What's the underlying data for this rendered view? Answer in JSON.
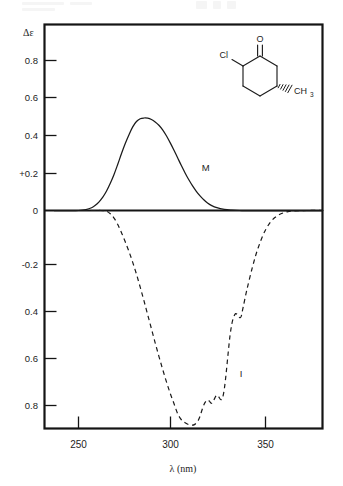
{
  "figure": {
    "kind": "cd-spectrum-plot",
    "background_color": "#ffffff",
    "ink_color": "#1a1a1a"
  },
  "chart_data": {
    "type": "line",
    "title": "",
    "subtitle": "",
    "xlabel": "λ  (nm)",
    "ylabel": "Δε",
    "xlim": [
      233,
      383
    ],
    "ylim": [
      -0.9,
      0.92
    ],
    "grid": false,
    "legend_position": "inline-annotation",
    "x_tick_labels": [
      "250",
      "300",
      "350"
    ],
    "x_tick_values": [
      250,
      300,
      350
    ],
    "y_tick_labels": [
      "0.8",
      "0.6",
      "0.4",
      "+0.2",
      "0",
      "-0.2",
      "0.4",
      "0.6",
      "0.8"
    ],
    "y_tick_values": [
      0.8,
      0.6,
      0.4,
      0.2,
      0,
      -0.2,
      -0.4,
      -0.6,
      -0.8
    ],
    "annotations": [
      {
        "text": "M",
        "x": 318,
        "y": 0.235,
        "series": "M"
      },
      {
        "text": "I",
        "x": 337,
        "y": -0.605,
        "series": "I"
      }
    ],
    "series": [
      {
        "name": "M",
        "label": "M",
        "style": "solid",
        "description": "positive Cotton effect band, single smooth maximum",
        "peak_x": 286,
        "peak_y": 0.5,
        "x": [
          237,
          242,
          246,
          250,
          254,
          257,
          259,
          261,
          263,
          265,
          267,
          269,
          271,
          273,
          275,
          277,
          279,
          281,
          283,
          285,
          287,
          289,
          291,
          293,
          295,
          297,
          299,
          301,
          303,
          305,
          307,
          309,
          311,
          313,
          315,
          317,
          319,
          321,
          324,
          328,
          332,
          336,
          340,
          345,
          352,
          360,
          370,
          380
        ],
        "y": [
          0.0,
          0.0,
          0.0,
          0.0,
          0.005,
          0.015,
          0.028,
          0.047,
          0.072,
          0.105,
          0.147,
          0.195,
          0.25,
          0.308,
          0.362,
          0.41,
          0.452,
          0.481,
          0.496,
          0.5,
          0.499,
          0.492,
          0.479,
          0.461,
          0.436,
          0.404,
          0.367,
          0.327,
          0.285,
          0.243,
          0.203,
          0.166,
          0.133,
          0.104,
          0.079,
          0.058,
          0.041,
          0.028,
          0.015,
          0.006,
          0.002,
          0.0,
          0.0,
          0.0,
          0.0,
          0.0,
          0.0,
          0.0
        ]
      },
      {
        "name": "I",
        "label": "I",
        "style": "dashed",
        "description": "negative Cotton effect band with vibrational fine structure near minimum",
        "trough_x": 314,
        "trough_y": -0.795,
        "x": [
          248,
          254,
          258,
          262,
          265,
          267,
          269,
          271,
          273,
          275,
          277,
          279,
          281,
          283,
          285,
          287,
          289,
          291,
          293,
          295,
          297,
          299,
          301,
          303,
          305,
          307,
          309,
          311,
          312,
          313,
          314,
          315,
          316,
          317,
          318,
          319,
          320,
          321,
          322,
          323,
          324,
          325,
          326,
          327,
          328,
          329,
          330,
          331,
          332,
          333,
          334,
          335,
          336,
          337,
          338,
          340,
          343,
          346,
          350,
          355,
          362,
          372,
          381
        ],
        "y": [
          0.0,
          0.0,
          0.0,
          0.0,
          -0.003,
          -0.012,
          -0.028,
          -0.052,
          -0.082,
          -0.116,
          -0.152,
          -0.192,
          -0.236,
          -0.284,
          -0.334,
          -0.386,
          -0.438,
          -0.49,
          -0.54,
          -0.588,
          -0.634,
          -0.676,
          -0.714,
          -0.752,
          -0.775,
          -0.786,
          -0.793,
          -0.795,
          -0.793,
          -0.787,
          -0.778,
          -0.762,
          -0.74,
          -0.72,
          -0.708,
          -0.702,
          -0.706,
          -0.714,
          -0.708,
          -0.693,
          -0.684,
          -0.69,
          -0.7,
          -0.695,
          -0.66,
          -0.6,
          -0.53,
          -0.465,
          -0.42,
          -0.394,
          -0.382,
          -0.386,
          -0.396,
          -0.392,
          -0.36,
          -0.295,
          -0.21,
          -0.14,
          -0.072,
          -0.026,
          -0.004,
          0.0,
          0.0
        ]
      }
    ]
  },
  "structure": {
    "name": "2-chloro-5-methylcyclohexan-1-one",
    "atom_labels": [
      {
        "id": "chlorine",
        "text": "Cl"
      },
      {
        "id": "carbonyl-oxygen",
        "text": "O"
      },
      {
        "id": "methyl",
        "text": "CH",
        "subscript": "3"
      }
    ]
  }
}
